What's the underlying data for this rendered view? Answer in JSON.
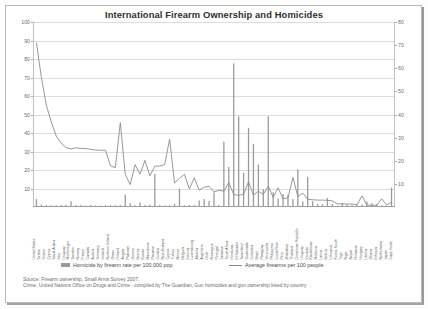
{
  "chart_data": {
    "type": "bar",
    "title": "International Firearm Ownership and Homicides",
    "xlabel": "",
    "ylabel": "",
    "ylim": [
      0,
      100
    ],
    "y2lim": [
      0,
      80
    ],
    "grid": true,
    "legend_position": "bottom",
    "left_axis_ticks": [
      "100",
      "90",
      "80",
      "70",
      "60",
      "50",
      "40",
      "30",
      "20",
      "10"
    ],
    "right_axis_ticks": [
      "80",
      "70",
      "60",
      "50",
      "40",
      "30",
      "20",
      "10"
    ],
    "categories": [
      "United States",
      "Serbia",
      "Yemen",
      "Cyprus",
      "Saudi Arabia",
      "Iraq",
      "Uruguay",
      "Montenegro",
      "Sweden",
      "Norway",
      "France",
      "Canada",
      "Austria",
      "Germany",
      "Iceland",
      "Northern Ireland",
      "Oman",
      "Finland",
      "Angola",
      "Pakistan",
      "Greece",
      "Bosnia",
      "Kuwait",
      "Macedonia",
      "Panama",
      "Croatia",
      "New Zealand",
      "Cyprus",
      "Turkey",
      "Mexico",
      "Belgium",
      "Estonia",
      "Luxembourg",
      "Albania",
      "Argentina",
      "Chile",
      "Nicaragua",
      "Portugal",
      "Jamaica",
      "South Africa",
      "Honduras",
      "El Salvador",
      "Swaziland",
      "Guatemala",
      "Colombia",
      "Brazil",
      "Paraguay",
      "Venezuela",
      "Philippines",
      "Costa Rica",
      "Peru",
      "Zimbabwe",
      "Thailand",
      "Dominican Republic",
      "Uruguay",
      "Ecuador",
      "Kazakhstan",
      "Moldova",
      "Latvia",
      "Bolivia",
      "Lithuania",
      "Korea, South",
      "Togo",
      "Niger",
      "Nepal",
      "Romania",
      "Hungary",
      "Liberia",
      "Ghana",
      "Ethiopia",
      "Netherlands",
      "Japan",
      "Cape Verde"
    ],
    "series": [
      {
        "name": "Homicide by firearm rate per 100,000 pop",
        "axis": "right",
        "type": "bar",
        "color": "#9a9a9a",
        "values": [
          3.0,
          0.6,
          0.4,
          0.3,
          0.3,
          0.4,
          0.5,
          2.1,
          0.4,
          0.4,
          0.2,
          0.5,
          0.2,
          0.2,
          0.3,
          0.4,
          0.3,
          0.4,
          5.0,
          1.2,
          0.3,
          1.5,
          0.4,
          0.6,
          14.0,
          0.4,
          0.2,
          0.3,
          1.0,
          7.5,
          0.3,
          0.4,
          0.4,
          2.4,
          3.0,
          2.2,
          5.9,
          0.4,
          28.0,
          17.0,
          62.0,
          39.0,
          14.5,
          34.0,
          27.0,
          18.0,
          7.3,
          39.0,
          6.0,
          3.3,
          5.2,
          4.8,
          3.0,
          16.0,
          2.0,
          12.7,
          2.1,
          0.8,
          0.7,
          3.5,
          0.9,
          0.1,
          1.2,
          0.6,
          0.4,
          0.6,
          0.6,
          2.0,
          1.2,
          0.8,
          0.3,
          0.1,
          8.0
        ]
      },
      {
        "name": "Average firearms per 100 people",
        "axis": "left",
        "type": "line",
        "color": "#8c8c8c",
        "values": [
          88.8,
          69.7,
          54.8,
          45.7,
          38.0,
          34.2,
          31.8,
          31.0,
          31.6,
          31.3,
          31.2,
          30.8,
          30.4,
          30.3,
          30.3,
          21.9,
          20.8,
          45.3,
          17.3,
          11.6,
          22.5,
          17.3,
          24.8,
          16.4,
          21.7,
          21.7,
          22.6,
          36.4,
          12.5,
          15.0,
          17.2,
          9.2,
          15.3,
          8.6,
          10.2,
          10.7,
          7.7,
          8.5,
          8.1,
          12.7,
          6.2,
          5.8,
          6.4,
          13.1,
          5.9,
          8.0,
          6.4,
          10.7,
          4.7,
          9.9,
          3.9,
          4.4,
          15.6,
          5.1,
          7.0,
          3.6,
          3.4,
          3.2,
          3.2,
          3.1,
          2.8,
          1.1,
          1.2,
          1.0,
          1.1,
          0.7,
          5.5,
          0.5,
          0.4,
          0.4,
          3.9,
          0.6,
          2.0
        ]
      }
    ],
    "legend": [
      "Homicide by firearm rate per 100,000 pop",
      "Average firearms per 100 people"
    ],
    "source_line_1": "Source: Firearm ownership, Small Arms Survey 2007,",
    "source_line_2": "Crime, United Nations Office on Drugs and Crime - compiled by The Guardian, Gun homicides and gun ownership listed by country",
    "source_prefix": "Source:"
  }
}
